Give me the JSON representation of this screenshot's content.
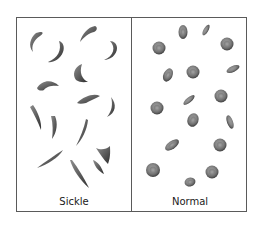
{
  "figure": {
    "panels": [
      {
        "id": "sickle",
        "label": "Sickle"
      },
      {
        "id": "normal",
        "label": "Normal"
      }
    ],
    "colors": {
      "frame": "#5a5a5a",
      "cell_dark": "#4a4a4a",
      "cell_mid": "#7a7a7a",
      "cell_light": "#a8a8a8"
    }
  }
}
